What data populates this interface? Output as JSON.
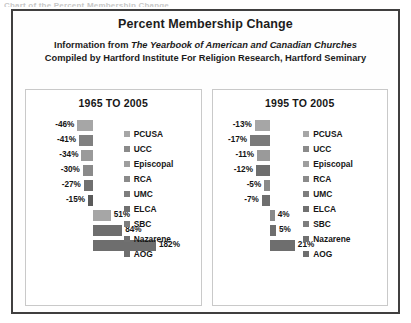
{
  "top_clip_text": "Chart of the Percent Membership Change",
  "title": "Percent Membership Change",
  "subtitle": {
    "line1_pre": "Information from ",
    "line1_italic": "The Yearbook of American and Canadian Churches",
    "line2": "Compiled by Hartford Institute For Religion Research, Hartford Seminary"
  },
  "colors": {
    "frame_border": "#403f3f",
    "panel_border": "#c9c9c9",
    "text": "#161616",
    "background": "#ffffff"
  },
  "chart_data": [
    {
      "type": "bar",
      "title": "1965 TO 2005",
      "orientation": "horizontal",
      "xlabel": "",
      "ylabel": "",
      "grid": false,
      "legend_position": "right",
      "xlim": [
        -60,
        200
      ],
      "categories": [
        "PCUSA",
        "UCC",
        "Episcopal",
        "RCA",
        "UMC",
        "ELCA",
        "SBC",
        "Nazarene",
        "AOG"
      ],
      "values": [
        -46,
        -41,
        -34,
        -30,
        -27,
        -15,
        51,
        84,
        182
      ],
      "labels": [
        "-46%",
        "-41%",
        "-34%",
        "-30%",
        "-27%",
        "-15%",
        "51%",
        "84%",
        "182%"
      ],
      "bar_colors": [
        "#a6a6a6",
        "#808080",
        "#9a9a9a",
        "#8a8a8a",
        "#707070",
        "#5a5a5a",
        "#a6a6a6",
        "#6e6e6e",
        "#6e6e6e"
      ]
    },
    {
      "type": "bar",
      "title": "1995 TO 2005",
      "orientation": "horizontal",
      "xlabel": "",
      "ylabel": "",
      "grid": false,
      "legend_position": "right",
      "xlim": [
        -25,
        25
      ],
      "categories": [
        "PCUSA",
        "UCC",
        "Episcopal",
        "RCA",
        "UMC",
        "ELCA",
        "SBC",
        "Nazarene",
        "AOG"
      ],
      "values": [
        -13,
        -17,
        -11,
        -12,
        -5,
        -7,
        4,
        5,
        21
      ],
      "labels": [
        "-13%",
        "-17%",
        "-11%",
        "-12%",
        "-5%",
        "-7%",
        "4%",
        "5%",
        "21%"
      ],
      "bar_colors": [
        "#a6a6a6",
        "#7a7a7a",
        "#9a9a9a",
        "#6e6e6e",
        "#8a8a8a",
        "#6e6e6e",
        "#8a8a8a",
        "#6e6e6e",
        "#6e6e6e"
      ]
    }
  ],
  "legend": {
    "items": [
      {
        "label": "PCUSA",
        "swatch": "#a6a6a6"
      },
      {
        "label": "UCC",
        "swatch": "#8a8a8a"
      },
      {
        "label": "Episcopal",
        "swatch": "#9e9e9e"
      },
      {
        "label": "RCA",
        "swatch": "#8a8a8a"
      },
      {
        "label": "UMC",
        "swatch": "#7d7d7d"
      },
      {
        "label": "ELCA",
        "swatch": "#707070"
      },
      {
        "label": "SBC",
        "swatch": "#7d7d7d"
      },
      {
        "label": "Nazarene",
        "swatch": "#707070"
      },
      {
        "label": "AOG",
        "swatch": "#6e6e6e"
      }
    ]
  }
}
